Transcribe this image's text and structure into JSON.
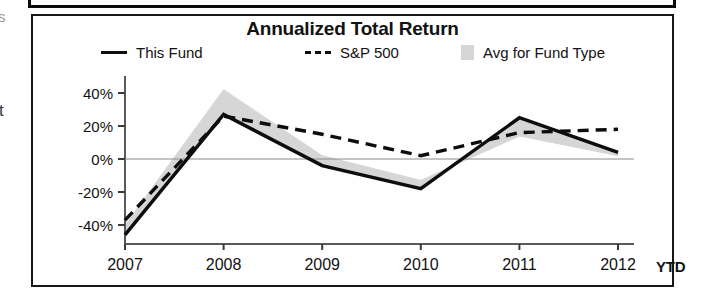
{
  "chart_data": {
    "type": "line",
    "title": "Annualized Total Return",
    "xlabel": "",
    "ylabel": "",
    "ylim": [
      -50,
      48
    ],
    "ytick_values": [
      40,
      20,
      0,
      -20,
      -40
    ],
    "ytick_labels": [
      "40%",
      "20%",
      "0%",
      "-20%",
      "-40%"
    ],
    "categories": [
      "2007",
      "2008",
      "2009",
      "2010",
      "2011",
      "2012"
    ],
    "last_category_suffix": "YTD",
    "grid": false,
    "zero_line": true,
    "legend_position": "top",
    "series": [
      {
        "name": "This Fund",
        "style": "solid",
        "color": "#0d0d0d",
        "values": [
          -46,
          27,
          -4,
          -18,
          25,
          4
        ]
      },
      {
        "name": "S&P 500",
        "style": "dashed",
        "color": "#0d0d0d",
        "values": [
          -37,
          26,
          15,
          2,
          16,
          18
        ]
      },
      {
        "name": "Avg for Fund Type",
        "style": "filled-band",
        "color": "#d6d6d6",
        "values": [
          -40,
          42,
          2,
          -13,
          14,
          2
        ]
      }
    ]
  },
  "legend": {
    "this_fund": "This Fund",
    "sp500": "S&P 500",
    "avg_fund_type": "Avg for Fund Type"
  },
  "artifacts": {
    "margin_char_top": "s",
    "margin_char_mid": "t"
  },
  "colors": {
    "line": "#0d0d0d",
    "band": "#d6d6d6",
    "frame": "#161616",
    "background": "#ffffff"
  }
}
